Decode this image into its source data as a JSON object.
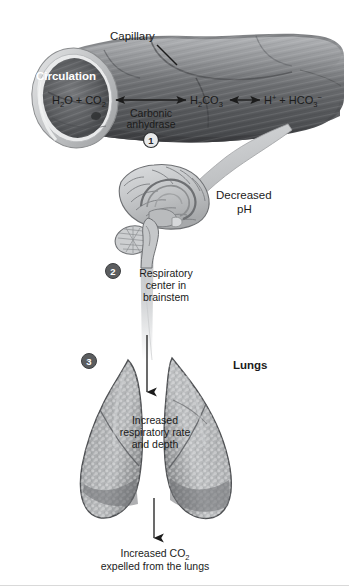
{
  "figure": {
    "background_color": "#ffffff",
    "ink_color": "#1b1b1b"
  },
  "capillary": {
    "label": "Capillary",
    "circulation_label": "Circulation",
    "marker": "1",
    "enzyme_label_line1": "Carbonic",
    "enzyme_label_line2": "anhydrase",
    "reaction": {
      "reactants": {
        "h2o": "H",
        "h2o_sub": "2",
        "h2o_rest": "O",
        "plus": "+",
        "co2": "CO",
        "co2_sub": "2"
      },
      "intermediate": {
        "h": "H",
        "h_sub": "2",
        "c": "CO",
        "c_sub": "3"
      },
      "products": {
        "hplus": "H",
        "hplus_sup": "+",
        "plus": "+",
        "hco3": "HCO",
        "hco3_sub": "3",
        "hco3_sup": "−"
      }
    },
    "reaction_plain": {
      "left": "H2O + CO2",
      "middle": "H2CO3",
      "right": "H+ + HCO3-"
    }
  },
  "brain": {
    "marker": "2",
    "decreased_ph_line1": "Decreased",
    "decreased_ph_line2": "pH",
    "respiratory_center_line1": "Respiratory",
    "respiratory_center_line2": "center in",
    "respiratory_center_line3": "brainstem"
  },
  "lungs": {
    "marker": "3",
    "label": "Lungs",
    "effect_line1": "Increased",
    "effect_line2": "respiratory rate",
    "effect_line3": "and depth",
    "outcome_line1": "Increased CO",
    "outcome_line1_sub": "2",
    "outcome_line2": "expelled from the lungs"
  },
  "colors": {
    "vessel_dark": "#585a5c",
    "vessel_mid": "#8e9093",
    "vessel_light": "#c3c5c7",
    "brain_fill": "#c9cbcd",
    "lung_fill": "#a9abad",
    "marker_dark": "#5b5d5f",
    "arrow_gray": "#b8babc",
    "outline": "#3d3f41"
  }
}
